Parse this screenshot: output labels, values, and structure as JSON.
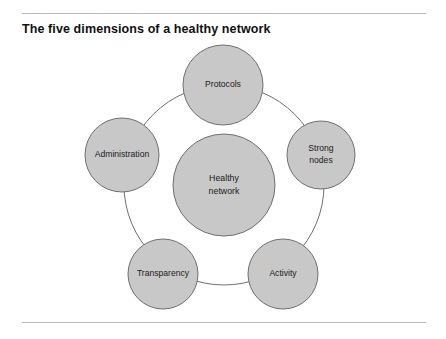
{
  "figure": {
    "title": "The five dimensions of a healthy network",
    "center_node": {
      "id": "healthy-network",
      "line1": "Healthy",
      "line2": "network"
    },
    "dimension_nodes": [
      {
        "id": "protocols",
        "line1": "Protocols",
        "line2": ""
      },
      {
        "id": "strong-nodes",
        "line1": "Strong",
        "line2": "nodes"
      },
      {
        "id": "activity",
        "line1": "Activity",
        "line2": ""
      },
      {
        "id": "transparency",
        "line1": "Transparency",
        "line2": ""
      },
      {
        "id": "administration",
        "line1": "Administration",
        "line2": ""
      }
    ],
    "colors": {
      "node_fill": "#c8c8c8",
      "node_stroke": "#6f6f6f",
      "ring_stroke": "#6f6f6f",
      "rule": "#b9b9b9",
      "text": "#1a1a1a",
      "background": "#ffffff"
    }
  }
}
